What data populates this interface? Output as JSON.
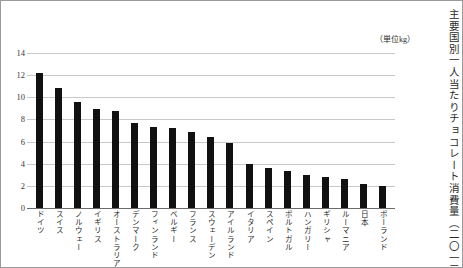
{
  "chart_title_vertical": "主要国別一人当たりチョコレート消費量（二〇一三年）",
  "unit_label": "（単位kg）",
  "chart_data": {
    "type": "bar",
    "title": "主要国別一人当たりチョコレート消費量（二〇一三年）",
    "xlabel": "",
    "ylabel": "",
    "unit": "kg",
    "ylim": [
      0,
      14
    ],
    "yticks": [
      "0",
      "2",
      "4",
      "6",
      "8",
      "10",
      "12",
      "14"
    ],
    "ytick_values": [
      0,
      2,
      4,
      6,
      8,
      10,
      12,
      14
    ],
    "grid": true,
    "legend": "none",
    "bar_color": "#111111",
    "grid_color": "#c9c9c9",
    "categories": [
      "ドイツ",
      "スイス",
      "ノルウェー",
      "イギリス",
      "オーストラリア",
      "デンマーク",
      "フィンランド",
      "ベルギー",
      "フランス",
      "スウェーデン",
      "アイルランド",
      "イタリア",
      "スペイン",
      "ポルトガル",
      "ハンガリー",
      "ギリシャ",
      "ルーマニア",
      "日本",
      "ポーランド"
    ],
    "values": [
      12.2,
      10.8,
      9.6,
      8.9,
      8.8,
      7.7,
      7.3,
      7.2,
      6.9,
      6.4,
      5.9,
      4.0,
      3.6,
      3.3,
      3.0,
      2.8,
      2.6,
      2.2,
      2.0
    ]
  }
}
